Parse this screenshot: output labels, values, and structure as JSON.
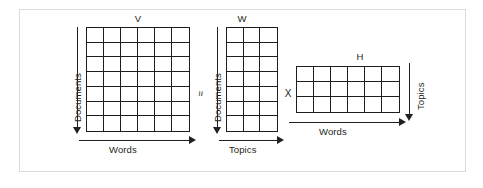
{
  "figure": {
    "background": "#ffffff",
    "frame_color": "#dcdcdc",
    "ink_color": "#231f20"
  },
  "operators": {
    "approx": "≈",
    "times": "X"
  },
  "matrices": [
    {
      "id": "V",
      "label": "V",
      "rows": 7,
      "cols": 6,
      "row_axis_label": "Documents",
      "col_axis_label": "Words",
      "row_axis_direction": "down",
      "col_axis_direction": "right"
    },
    {
      "id": "W",
      "label": "W",
      "rows": 7,
      "cols": 3,
      "row_axis_label": "Documents",
      "col_axis_label": "Topics",
      "row_axis_direction": "down",
      "col_axis_direction": "right"
    },
    {
      "id": "H",
      "label": "H",
      "rows": 3,
      "cols": 6,
      "row_axis_label": "Topics",
      "col_axis_label": "Words",
      "row_axis_direction": "down",
      "col_axis_direction": "right"
    }
  ]
}
